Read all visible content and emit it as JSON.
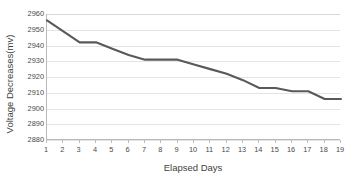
{
  "chart_data": {
    "type": "line",
    "title": "",
    "xlabel": "Elapsed Days",
    "ylabel": "Voltage Decreases(mv)",
    "x": [
      1,
      2,
      3,
      4,
      5,
      6,
      7,
      8,
      9,
      10,
      11,
      12,
      13,
      14,
      15,
      16,
      17,
      18,
      19
    ],
    "values": [
      2956,
      2949,
      2942,
      2942,
      2938,
      2934,
      2931,
      2931,
      2931,
      2928,
      2925,
      2922,
      2918,
      2913,
      2913,
      2911,
      2911,
      2906,
      2906
    ],
    "series": [
      {
        "name": "Voltage Decreases(mv)",
        "values": [
          2956,
          2949,
          2942,
          2942,
          2938,
          2934,
          2931,
          2931,
          2931,
          2928,
          2925,
          2922,
          2918,
          2913,
          2913,
          2911,
          2911,
          2906,
          2906
        ]
      }
    ],
    "xlim": [
      1,
      19
    ],
    "ylim": [
      2880,
      2960
    ],
    "ytick_labels": [
      "2960",
      "2950",
      "2940",
      "2930",
      "2920",
      "2910",
      "2900",
      "2890",
      "2880"
    ],
    "yticks": [
      2960,
      2950,
      2940,
      2930,
      2920,
      2910,
      2900,
      2890,
      2880
    ],
    "xtick_labels": [
      "1",
      "2",
      "3",
      "4",
      "5",
      "6",
      "7",
      "8",
      "9",
      "10",
      "11",
      "12",
      "13",
      "14",
      "15",
      "16",
      "17",
      "18",
      "19"
    ],
    "grid": true,
    "grid_axis": "y",
    "legend": false,
    "legend_position": "none",
    "line_color": "#595959",
    "grid_color": "#e4e4e4",
    "axis_color": "#b9b9b9",
    "text_color": "#4a4a4a",
    "background_color": "#ffffff"
  }
}
